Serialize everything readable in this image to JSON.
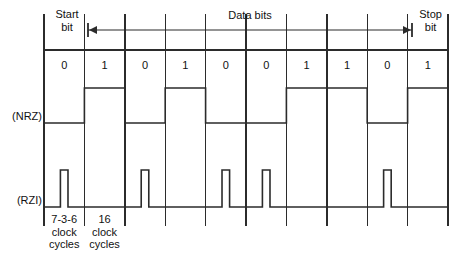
{
  "geometry": {
    "width": 462,
    "height": 271,
    "grid_left": 44,
    "grid_right": 448,
    "cell_width": 40.4,
    "top_rule_y": 14,
    "bitrow_top_y": 50,
    "bitrow_bottom_y": 88,
    "nrz_high_y": 88,
    "nrz_low_y": 123,
    "nrz_label_y": 117,
    "rzi_high_y": 170,
    "rzi_base_y": 207,
    "tick_bottom_y": 226,
    "arrow_y": 30,
    "arrow_x_start": 88,
    "arrow_x_end": 412
  },
  "labels": {
    "start_bit": "Start\nbit",
    "stop_bit": "Stop\nbit",
    "data_bits": "Data bits",
    "nrz": "(NRZ)",
    "rzi": "(RZI)",
    "start_cycles": "7-3-6\nclock\ncycles",
    "data_cycles": "16\nclock\ncycles"
  },
  "colors": {
    "line": "#2b2b2b",
    "text": "#111111",
    "background": "#ffffff"
  },
  "chart_data": {
    "type": "line",
    "xlabel": "",
    "ylabel": "",
    "bit_labels": [
      "0",
      "1",
      "0",
      "1",
      "0",
      "0",
      "1",
      "1",
      "0",
      "1"
    ],
    "bits": [
      0,
      1,
      0,
      1,
      0,
      0,
      1,
      1,
      0,
      1
    ],
    "series": [
      {
        "name": "(NRZ)",
        "description": "Non-return-to-zero: level held high for a 1 and low for a 0 for the whole bit cell",
        "values": [
          0,
          1,
          0,
          1,
          0,
          0,
          1,
          1,
          0,
          1
        ]
      },
      {
        "name": "(RZI)",
        "description": "Return-to-zero-inverted: a short 3/16 pulse is emitted in the middle of every bit cell that carries a 0",
        "pulse_cells": [
          0,
          2,
          4,
          5,
          8
        ],
        "values": [
          1,
          0,
          1,
          0,
          1,
          1,
          0,
          0,
          1,
          0
        ],
        "pulse_width_fraction": 0.1875,
        "pulse_center_fraction": 0.5
      }
    ],
    "annotations": [
      {
        "text": "Start bit",
        "cell": 0
      },
      {
        "text": "Data bits",
        "cells": [
          1,
          8
        ],
        "arrow": "double"
      },
      {
        "text": "Stop bit",
        "cell": 9
      },
      {
        "text": "7-3-6 clock cycles",
        "cell": 0
      },
      {
        "text": "16 clock cycles",
        "cell": 1
      }
    ],
    "grid": true,
    "legend": "inline-left"
  }
}
